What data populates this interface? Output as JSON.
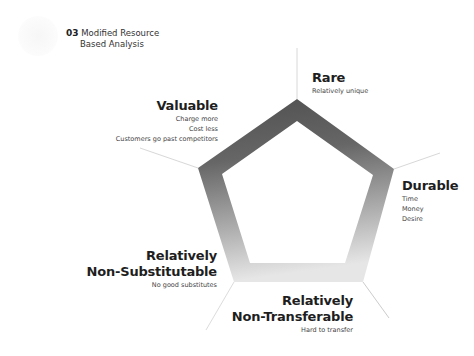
{
  "header": {
    "number": "03",
    "title_line1": "Modified Resource",
    "title_line2": "Based Analysis"
  },
  "logo": {
    "icon": "faint-crest-logo-icon"
  },
  "diagram": {
    "shape": "pentagon-ring",
    "gradient": {
      "top_color": "#585858",
      "bottom_color": "#e4e4e4"
    },
    "nodes": [
      {
        "id": "rare",
        "heading": "Rare",
        "heading_line2": "",
        "items": [
          "Relatively unique"
        ]
      },
      {
        "id": "valuable",
        "heading": "Valuable",
        "heading_line2": "",
        "items": [
          "Charge more",
          "Cost less",
          "Customers go past competitors"
        ]
      },
      {
        "id": "durable",
        "heading": "Durable",
        "heading_line2": "",
        "items": [
          "Time",
          "Money",
          "Desire"
        ]
      },
      {
        "id": "non-substitutable",
        "heading": "Relatively",
        "heading_line2": "Non-Substitutable",
        "items": [
          "No good substitutes"
        ]
      },
      {
        "id": "non-transferable",
        "heading": "Relatively",
        "heading_line2": "Non-Transferable",
        "items": [
          "Hard to transfer"
        ]
      }
    ]
  }
}
